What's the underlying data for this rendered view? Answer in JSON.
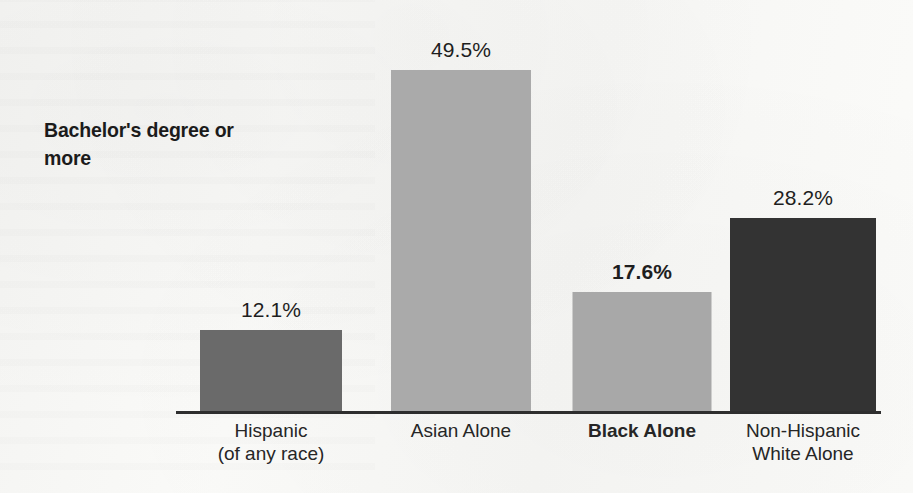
{
  "title": "Bachelor's degree\nor more",
  "colors": {
    "background": "#f7f7f5",
    "axis": "#2e2e2e",
    "text": "#1e1e1e",
    "bar_hispanic": "#6a6a6a",
    "bar_asian": "#aaaaaa",
    "bar_black": "#a8a8a8",
    "bar_nh_white": "#333333"
  },
  "chart_data": {
    "type": "bar",
    "title": "Bachelor's degree or more",
    "xlabel": "",
    "ylabel": "",
    "ylim": [
      0,
      57
    ],
    "grid": false,
    "legend": "none",
    "value_suffix": "%",
    "categories": [
      "Hispanic\n(of any race)",
      "Asian Alone",
      "Black Alone",
      "Non-Hispanic\nWhite Alone"
    ],
    "values": [
      12.1,
      49.5,
      17.6,
      28.2
    ],
    "value_labels": [
      "12.1%",
      "49.5%",
      "17.6%",
      "28.2%"
    ],
    "bar_colors": [
      "#6a6a6a",
      "#aaaaaa",
      "#a8a8a8",
      "#333333"
    ],
    "emphasis": [
      false,
      false,
      true,
      false
    ],
    "bars": [
      {
        "category": "Hispanic\n(of any race)",
        "value": 12.1,
        "value_label": "12.1%",
        "color": "#6a6a6a",
        "bold": false
      },
      {
        "category": "Asian Alone",
        "value": 49.5,
        "value_label": "49.5%",
        "color": "#aaaaaa",
        "bold": false
      },
      {
        "category": "Black Alone",
        "value": 17.6,
        "value_label": "17.6%",
        "color": "#a8a8a8",
        "bold": true
      },
      {
        "category": "Non-Hispanic\nWhite Alone",
        "value": 28.2,
        "value_label": "28.2%",
        "color": "#333333",
        "bold": false
      }
    ]
  }
}
